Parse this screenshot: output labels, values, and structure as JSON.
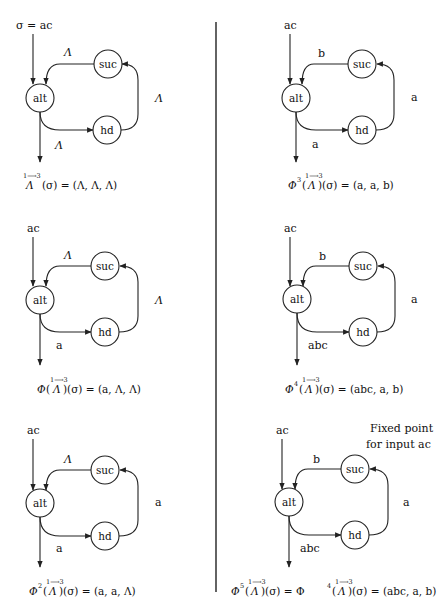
{
  "figure": {
    "divider": {
      "x": 216,
      "y1": 22,
      "y2": 592
    },
    "nodes": {
      "alt": "alt",
      "suc": "suc",
      "hd": "hd"
    },
    "symbols": {
      "lambda": "Λ",
      "sigma": "σ",
      "phi": "Φ",
      "arrow_sup": "1⟶3"
    },
    "panels": [
      {
        "id": "p1",
        "input_label": "σ = ac",
        "edge_suc_alt": "Λ",
        "edge_hd_suc": "Λ",
        "edge_alt_out": "Λ",
        "caption": {
          "prefix": "",
          "power": "",
          "rhs": "(σ) = (Λ, Λ, Λ)"
        }
      },
      {
        "id": "p2",
        "input_label": "ac",
        "edge_suc_alt": "b",
        "edge_hd_suc": "a",
        "edge_alt_out": "a",
        "caption": {
          "prefix": "Φ",
          "power": "3",
          "rhs": ")(σ) = (a, a, b)"
        }
      },
      {
        "id": "p3",
        "input_label": "ac",
        "edge_suc_alt": "Λ",
        "edge_hd_suc": "Λ",
        "edge_alt_out": "a",
        "caption": {
          "prefix": "Φ",
          "power": "",
          "rhs": ")(σ) = (a, Λ, Λ)"
        }
      },
      {
        "id": "p4",
        "input_label": "ac",
        "edge_suc_alt": "b",
        "edge_hd_suc": "a",
        "edge_alt_out": "abc",
        "caption": {
          "prefix": "Φ",
          "power": "4",
          "rhs": ")(σ) = (abc, a, b)"
        }
      },
      {
        "id": "p5",
        "input_label": "ac",
        "edge_suc_alt": "Λ",
        "edge_hd_suc": "a",
        "edge_alt_out": "a",
        "caption": {
          "prefix": "Φ",
          "power": "2",
          "rhs": ")(σ) = (a, a, Λ)"
        }
      },
      {
        "id": "p6",
        "input_label": "ac",
        "edge_suc_alt": "b",
        "edge_hd_suc": "a",
        "edge_alt_out": "abc",
        "note_line1": "Fixed point",
        "note_line2": "for input ac",
        "caption": {
          "prefix": "Φ",
          "power": "5",
          "mid": ")(σ) = Φ",
          "power2": "4",
          "rhs": ")(σ) = (abc, a, b)"
        }
      }
    ]
  }
}
